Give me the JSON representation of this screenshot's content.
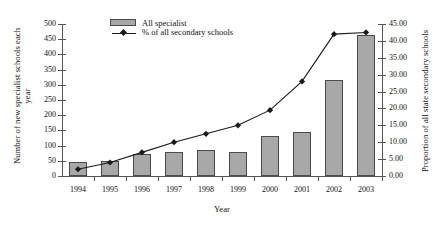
{
  "chart_data": {
    "type": "bar",
    "title": "",
    "xlabel": "Year",
    "ylabel": "Number of new specialist schools each year",
    "y2label": "Proportion of all state secondary schools",
    "categories": [
      "1994",
      "1995",
      "1996",
      "1997",
      "1998",
      "1999",
      "2000",
      "2001",
      "2002",
      "2003"
    ],
    "ylim": [
      0,
      500
    ],
    "y2lim": [
      0,
      45
    ],
    "yticks": [
      "0",
      "50",
      "100",
      "150",
      "200",
      "250",
      "300",
      "350",
      "400",
      "450",
      "500"
    ],
    "y2ticks": [
      "0.00",
      "5.00",
      "10.00",
      "15.00",
      "20.00",
      "25.00",
      "30.00",
      "35.00",
      "40.00",
      "45.00"
    ],
    "grid": false,
    "legend_position": "top-center",
    "series": [
      {
        "name": "All specialist",
        "kind": "bar",
        "axis": "left",
        "color": "#a8a8a8",
        "values": [
          45,
          48,
          72,
          78,
          85,
          80,
          130,
          145,
          315,
          465
        ]
      },
      {
        "name": "% of all secondary schools",
        "kind": "line",
        "axis": "right",
        "color": "#1a1a1a",
        "values": [
          2.0,
          4.0,
          7.0,
          10.0,
          12.5,
          15.0,
          19.5,
          28.0,
          42.0,
          42.5
        ]
      }
    ]
  },
  "legend": {
    "bar_label": "All specialist",
    "line_label": "% of all secondary schools"
  },
  "axes": {
    "x_title": "Year",
    "y_title": "Number of new specialist schools each year",
    "y2_title": "Proportion of all state secondary schools"
  }
}
